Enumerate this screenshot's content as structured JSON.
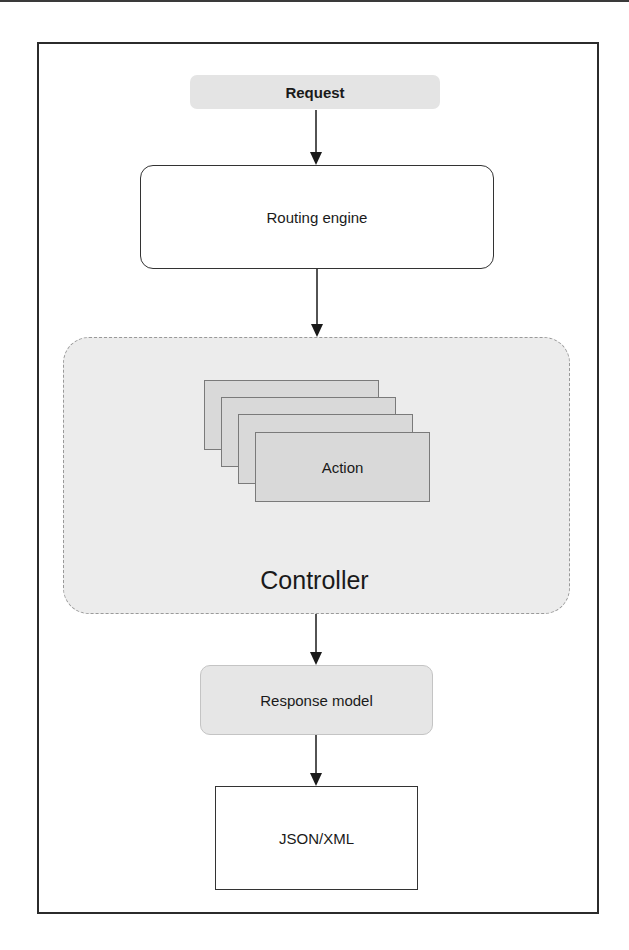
{
  "diagram": {
    "nodes": {
      "request": "Request",
      "routing_engine": "Routing engine",
      "action": "Action",
      "controller": "Controller",
      "response_model": "Response model",
      "output": "JSON/XML"
    },
    "flow": [
      "Request",
      "Routing engine",
      "Controller",
      "Response model",
      "JSON/XML"
    ],
    "action_stack_count": 4
  }
}
